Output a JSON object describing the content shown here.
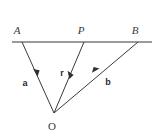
{
  "figure": {
    "background_color": "#ffffff",
    "points": {
      "A": {
        "label": "A",
        "x": 22,
        "y": 42,
        "label_x": 20,
        "label_y": 33
      },
      "P": {
        "label": "P",
        "x": 84,
        "y": 42,
        "label_x": 82,
        "label_y": 33
      },
      "B": {
        "label": "B",
        "x": 138,
        "y": 42,
        "label_x": 134,
        "label_y": 33
      },
      "O": {
        "label": "O",
        "x": 54,
        "y": 113,
        "label_x": 52,
        "label_y": 129
      }
    },
    "vectors": [
      {
        "name": "a",
        "label": "a",
        "from": "A",
        "to": "O",
        "direction": "toward-O",
        "label_x": 25,
        "label_y": 85,
        "arrow_x": 37,
        "arrow_y": 74,
        "color": "#3a3a3a"
      },
      {
        "name": "r",
        "label": "r",
        "from": "P",
        "to": "O",
        "direction": "toward-O",
        "label_x": 61,
        "label_y": 76,
        "arrow_x": 71,
        "arrow_y": 77,
        "color": "#3a3a3a"
      },
      {
        "name": "b",
        "label": "b",
        "from": "O",
        "to": "B",
        "direction": "away-from-O",
        "label_x": 106,
        "label_y": 84,
        "arrow_x": 97,
        "arrow_y": 72,
        "color": "#3a3a3a"
      }
    ],
    "baseline": {
      "name": "line-APB",
      "x1": 12,
      "y1": 42,
      "x2": 152,
      "y2": 42,
      "color": "#9a9a9a",
      "width": 2
    },
    "line_color": "#3a3a3a",
    "label_color": "#3b3b3b"
  }
}
